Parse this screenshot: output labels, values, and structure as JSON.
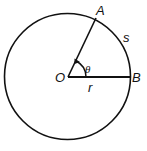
{
  "diagram": {
    "labels": {
      "center": "O",
      "point_a": "A",
      "point_b": "B",
      "angle": "θ",
      "radius": "r",
      "arc": "s"
    },
    "colors": {
      "stroke": "#111111",
      "background": "#ffffff"
    }
  }
}
